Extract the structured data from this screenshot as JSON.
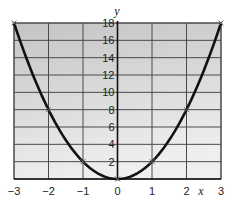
{
  "chart_data": {
    "type": "line",
    "title": "",
    "xlabel": "x",
    "ylabel": "y",
    "xlim": [
      -3,
      3
    ],
    "ylim": [
      0,
      18
    ],
    "grid": true,
    "x_ticks": [
      -3,
      -2,
      -1,
      0,
      1,
      2,
      3
    ],
    "x_tick_labels": [
      "−3",
      "−2",
      "−1",
      "0",
      "1",
      "2",
      "3"
    ],
    "y_ticks": [
      2,
      4,
      6,
      8,
      10,
      12,
      14,
      16,
      18
    ],
    "y_tick_labels": [
      "2",
      "4",
      "6",
      "8",
      "10",
      "12",
      "14",
      "16",
      "18"
    ],
    "series": [
      {
        "name": "y = 2x²",
        "x": [
          -3,
          -2,
          -1,
          0,
          1,
          2,
          3
        ],
        "y": [
          18,
          8,
          2,
          0,
          2,
          8,
          18
        ],
        "markers": "x",
        "color": "#111111"
      }
    ],
    "legend": null
  },
  "style": {
    "bg_top": "#c4c4c4",
    "bg_bottom": "#efefef",
    "grid_color": "#4a4a4a",
    "curve_color": "#111111"
  }
}
